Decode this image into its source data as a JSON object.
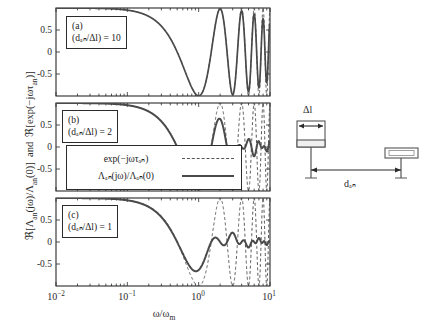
{
  "chart_data": {
    "type": "line",
    "title": "",
    "xlabel": "ω/ωₘ",
    "ylabel": "ℜ[Λₐₙ(jω)/Λₐₙ(0)]  and  ℜ[exp(−jωτₐₙ)]",
    "xscale": "log",
    "xlim": [
      0.01,
      10
    ],
    "ylim": [
      -1.0,
      1.0
    ],
    "xticks": [
      0.01,
      0.1,
      1,
      10
    ],
    "xticklabels": [
      "10⁻²",
      "10⁻¹",
      "10⁰",
      "10¹"
    ],
    "yticks": [
      0.5,
      0,
      -0.5
    ],
    "yticklabels": [
      "0.5",
      "0",
      "-0.5"
    ],
    "grid": false,
    "legend_position": "lower-left-panel-b",
    "series_names": [
      "exp(−jωτₐₙ)",
      "Λₐₙ(jω)/Λₐₙ(0)"
    ],
    "panels": [
      {
        "tag": "(a)",
        "condition": "(dₐₙ/Δl) = 10",
        "ratio": 10,
        "tau_norm": 3.1415926,
        "aperture": 0.31415926,
        "description": "Ideal delay cosine and sinc-weighted response nearly coincide; rapid oscillation toward high frequency."
      },
      {
        "tag": "(b)",
        "condition": "(dₐₙ/Δl) = 2",
        "ratio": 2,
        "tau_norm": 3.1415926,
        "aperture": 1.5707963,
        "description": "Sinc weighting attenuates the oscillation of the solid curve relative to the dashed ideal delay."
      },
      {
        "tag": "(c)",
        "condition": "(dₐₙ/Δl) = 1",
        "ratio": 1,
        "tau_norm": 3.1415926,
        "aperture": 3.1415926,
        "description": "Strongest aperture averaging; solid curve strongly damped, dashed curve reaches -1."
      }
    ],
    "sampled_curves": {
      "note": "Values of the real part sampled at decades of ω/ωₘ for each panel.",
      "x": [
        0.01,
        0.0316,
        0.1,
        0.316,
        1.0,
        1.78,
        3.16,
        5.62,
        10.0
      ],
      "panel_a_ideal": [
        1.0,
        1.0,
        0.995,
        0.951,
        0.54,
        -0.74,
        -0.74,
        0.35,
        0.85
      ],
      "panel_a_actual": [
        1.0,
        1.0,
        0.995,
        0.95,
        0.53,
        -0.72,
        -0.7,
        0.3,
        0.55
      ],
      "panel_b_ideal": [
        1.0,
        1.0,
        0.995,
        0.951,
        0.54,
        -0.74,
        -0.74,
        0.35,
        0.85
      ],
      "panel_b_actual": [
        1.0,
        1.0,
        0.99,
        0.93,
        0.49,
        -0.5,
        -0.42,
        0.18,
        0.16
      ],
      "panel_c_ideal": [
        1.0,
        1.0,
        0.995,
        0.951,
        0.54,
        -0.74,
        -0.95,
        0.1,
        0.85
      ],
      "panel_c_actual": [
        1.0,
        1.0,
        0.985,
        0.9,
        0.4,
        -0.3,
        -0.38,
        -0.18,
        -0.12
      ]
    }
  },
  "inset": {
    "name": "antenna-geometry-diagram",
    "delta_l_label": "Δl",
    "distance_label": "dₐₙ",
    "elements": [
      "transmit-aperture",
      "receive-aperture"
    ]
  },
  "colors": {
    "ideal_curve": "#555555",
    "actual_curve": "#4a4a4a",
    "axis": "#2b2b2b",
    "background": "#ffffff"
  }
}
